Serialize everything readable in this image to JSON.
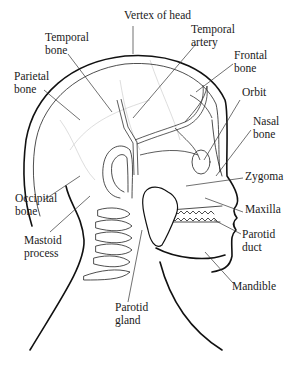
{
  "diagram": {
    "labels": [
      {
        "id": "vertex-of-head",
        "lines": [
          "Vertex of head"
        ],
        "x": 124,
        "y": 19
      },
      {
        "id": "temporal-bone",
        "lines": [
          "Temporal",
          "bone"
        ],
        "x": 45,
        "y": 41
      },
      {
        "id": "temporal-artery",
        "lines": [
          "Temporal",
          "artery"
        ],
        "x": 191,
        "y": 33
      },
      {
        "id": "parietal-bone",
        "lines": [
          "Parietal",
          "bone"
        ],
        "x": 14,
        "y": 80
      },
      {
        "id": "frontal-bone",
        "lines": [
          "Frontal",
          "bone"
        ],
        "x": 234,
        "y": 59
      },
      {
        "id": "orbit",
        "lines": [
          "Orbit"
        ],
        "x": 242,
        "y": 96
      },
      {
        "id": "nasal-bone",
        "lines": [
          "Nasal",
          "bone"
        ],
        "x": 253,
        "y": 125
      },
      {
        "id": "zygoma",
        "lines": [
          "Zygoma"
        ],
        "x": 245,
        "y": 180
      },
      {
        "id": "occipital-bone",
        "lines": [
          "Occipital",
          "bone"
        ],
        "x": 15,
        "y": 202
      },
      {
        "id": "maxilla",
        "lines": [
          "Maxilla"
        ],
        "x": 245,
        "y": 213
      },
      {
        "id": "mastoid-process",
        "lines": [
          "Mastoid",
          "process"
        ],
        "x": 24,
        "y": 244
      },
      {
        "id": "parotid-duct",
        "lines": [
          "Parotid",
          "duct"
        ],
        "x": 242,
        "y": 238
      },
      {
        "id": "mandible",
        "lines": [
          "Mandible"
        ],
        "x": 232,
        "y": 290
      },
      {
        "id": "parotid-gland",
        "lines": [
          "Parotid",
          "gland"
        ],
        "x": 115,
        "y": 311
      }
    ]
  }
}
